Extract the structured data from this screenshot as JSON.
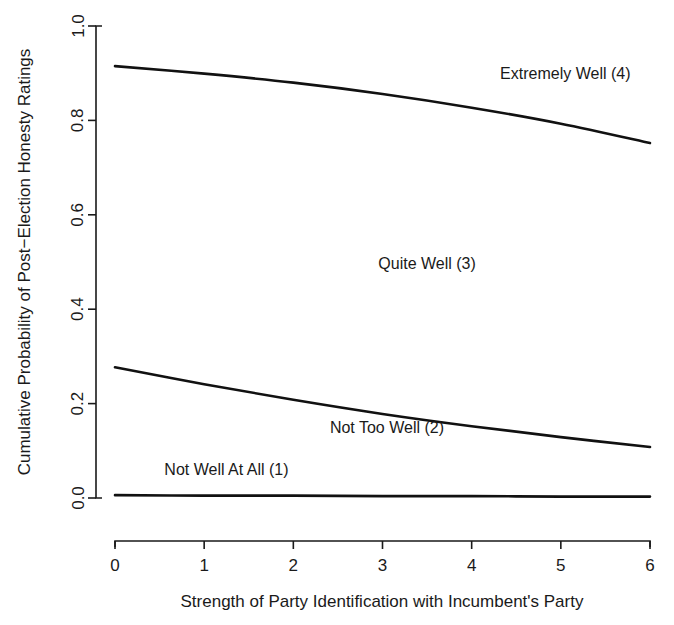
{
  "chart_data": {
    "type": "line",
    "title": "",
    "subtitle": "",
    "xlabel": "Strength of Party Identification with Incumbent's Party",
    "ylabel": "Cumulative Probability of Post−Election Honesty Ratings",
    "xlim": [
      0,
      6
    ],
    "ylim": [
      0.0,
      1.0
    ],
    "grid": false,
    "legend_position": "inline-annotations",
    "xticks": [
      "0",
      "1",
      "2",
      "3",
      "4",
      "5",
      "6"
    ],
    "xtick_values": [
      0,
      1,
      2,
      3,
      4,
      5,
      6
    ],
    "yticks": [
      "0.0",
      "0.2",
      "0.4",
      "0.6",
      "0.8",
      "1.0"
    ],
    "ytick_values": [
      0.0,
      0.2,
      0.4,
      0.6,
      0.8,
      1.0
    ],
    "x": [
      0,
      1,
      2,
      3,
      4,
      5,
      6
    ],
    "series": [
      {
        "name": "Cumulative probability through Quite Well (3)",
        "values": [
          0.915,
          0.899,
          0.88,
          0.856,
          0.827,
          0.793,
          0.752
        ]
      },
      {
        "name": "Cumulative probability through Not Too Well (2)",
        "values": [
          0.277,
          0.241,
          0.208,
          0.178,
          0.152,
          0.129,
          0.108
        ]
      },
      {
        "name": "Cumulative probability through Not Well At All (1)",
        "values": [
          0.006,
          0.005,
          0.005,
          0.004,
          0.004,
          0.003,
          0.003
        ]
      }
    ],
    "annotations": [
      {
        "text": "Extremely Well (4)",
        "x": 5.05,
        "y": 0.888,
        "anchor": "middle"
      },
      {
        "text": "Quite Well (3)",
        "x": 3.5,
        "y": 0.485,
        "anchor": "middle"
      },
      {
        "text": "Not Too Well (2)",
        "x": 3.05,
        "y": 0.138,
        "anchor": "middle"
      },
      {
        "text": "Not Well At All (1)",
        "x": 1.25,
        "y": 0.048,
        "anchor": "middle"
      }
    ]
  },
  "axes": {
    "y_title": "Cumulative Probability of Post−Election Honesty Ratings",
    "x_title": "Strength of Party Identification with Incumbent's Party",
    "y_tick_labels": [
      "1.0",
      "0.8",
      "0.6",
      "0.4",
      "0.2",
      "0.0"
    ],
    "x_tick_labels": [
      "0",
      "1",
      "2",
      "3",
      "4",
      "5",
      "6"
    ]
  },
  "annotations": {
    "extremely_well": "Extremely Well (4)",
    "quite_well": "Quite Well (3)",
    "not_too_well": "Not Too Well (2)",
    "not_well_at_all": "Not Well At All (1)"
  },
  "colors": {
    "line": "#111111",
    "axis": "#1a1a1a",
    "background": "#ffffff"
  }
}
